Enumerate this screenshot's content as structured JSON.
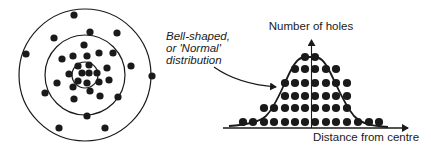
{
  "colors": {
    "ink": "#1a1a1a",
    "background": "#ffffff"
  },
  "target": {
    "center": [
      85,
      75
    ],
    "rings": [
      {
        "name": "outer",
        "radius": 66
      },
      {
        "name": "middle",
        "radius": 40
      },
      {
        "name": "inner",
        "radius": 13
      }
    ],
    "holes": [
      [
        74,
        15
      ],
      [
        54,
        38
      ],
      [
        90,
        32
      ],
      [
        117,
        33
      ],
      [
        26,
        54
      ],
      [
        152,
        76
      ],
      [
        131,
        66
      ],
      [
        84,
        45
      ],
      [
        62,
        59
      ],
      [
        73,
        56
      ],
      [
        87,
        56
      ],
      [
        99,
        53
      ],
      [
        113,
        53
      ],
      [
        107,
        68
      ],
      [
        78,
        66
      ],
      [
        89,
        65
      ],
      [
        69,
        74
      ],
      [
        82,
        73
      ],
      [
        89,
        73
      ],
      [
        97,
        73
      ],
      [
        57,
        83
      ],
      [
        78,
        81
      ],
      [
        87,
        83
      ],
      [
        73,
        87
      ],
      [
        99,
        82
      ],
      [
        109,
        80
      ],
      [
        45,
        93
      ],
      [
        90,
        91
      ],
      [
        74,
        99
      ],
      [
        100,
        96
      ],
      [
        118,
        97
      ],
      [
        87,
        116
      ],
      [
        59,
        128
      ],
      [
        105,
        128
      ]
    ]
  },
  "annotation": {
    "lines": [
      "Bell-shaped,",
      "or 'Normal'",
      "distribution"
    ]
  },
  "histogram": {
    "y_axis_label": "Number of holes",
    "x_axis_label": "Distance from centre"
  },
  "chart_data": {
    "type": "bar",
    "title": "",
    "xlabel": "Distance from centre",
    "ylabel": "Number of holes",
    "categories": [
      1,
      2,
      3,
      4,
      5,
      6,
      7,
      8,
      9,
      10,
      11,
      12,
      13,
      14
    ],
    "values": [
      1,
      1,
      2,
      2,
      4,
      5,
      6,
      6,
      5,
      5,
      4,
      1,
      1,
      1
    ],
    "column_x": [
      243,
      253,
      264,
      274,
      285,
      295,
      305,
      315,
      326,
      336,
      347,
      358,
      369,
      379
    ],
    "row_y": [
      122,
      108,
      96,
      83,
      69,
      57
    ],
    "curve": "bell-shaped (normal) distribution overlay",
    "grid": false,
    "legend": null
  }
}
